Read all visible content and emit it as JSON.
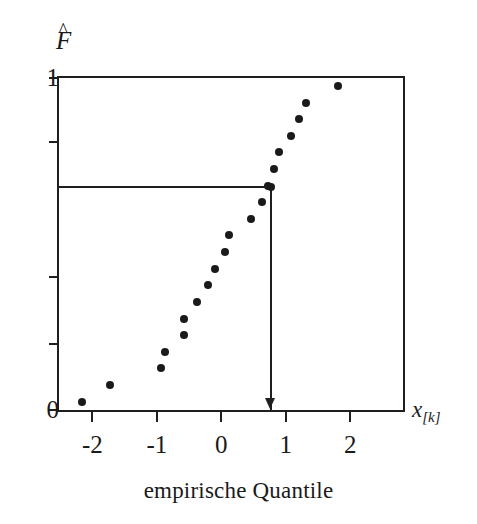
{
  "figure": {
    "caption": "empirische Quantile",
    "ylabel_base": "F",
    "ylabel_hat": "^",
    "xlabel_base": "x",
    "xlabel_sub": "[k]"
  },
  "chart_data": {
    "type": "scatter",
    "title": "",
    "subtitle": "",
    "xlabel": "x[k]",
    "ylabel": "F̂",
    "caption": "empirische Quantile",
    "xlim": [
      -2.55,
      2.85
    ],
    "ylim": [
      0,
      1
    ],
    "grid": false,
    "legend": null,
    "x_ticks": [
      -2,
      -1,
      0,
      1,
      2
    ],
    "x_tick_labels": [
      "-2",
      "-1",
      "0",
      "1",
      "2"
    ],
    "y_ticks": [
      0,
      0.2,
      0.4,
      0.805,
      1
    ],
    "y_tick_labels": [
      "0",
      "",
      "",
      "",
      "1"
    ],
    "y_labeled_ticks": [
      {
        "value": 1,
        "label": "1"
      },
      {
        "value": 0,
        "label": "0"
      }
    ],
    "series": [
      {
        "name": "empirische Verteilungsfunktion",
        "marker": "filled-circle",
        "color": "#1a1a1a",
        "points": [
          {
            "x": -2.16,
            "y": 0.025
          },
          {
            "x": -1.72,
            "y": 0.075
          },
          {
            "x": -0.94,
            "y": 0.125
          },
          {
            "x": -0.87,
            "y": 0.175
          },
          {
            "x": -0.58,
            "y": 0.225
          },
          {
            "x": -0.58,
            "y": 0.275
          },
          {
            "x": -0.37,
            "y": 0.325
          },
          {
            "x": -0.21,
            "y": 0.375
          },
          {
            "x": -0.1,
            "y": 0.425
          },
          {
            "x": 0.05,
            "y": 0.475
          },
          {
            "x": 0.12,
            "y": 0.525
          },
          {
            "x": 0.46,
            "y": 0.575
          },
          {
            "x": 0.63,
            "y": 0.625
          },
          {
            "x": 0.72,
            "y": 0.675
          },
          {
            "x": 0.81,
            "y": 0.725
          },
          {
            "x": 0.89,
            "y": 0.775
          },
          {
            "x": 1.08,
            "y": 0.825
          },
          {
            "x": 1.2,
            "y": 0.875
          },
          {
            "x": 1.32,
            "y": 0.925
          },
          {
            "x": 1.81,
            "y": 0.975
          }
        ]
      }
    ],
    "annotations": [
      {
        "type": "guide-lines",
        "description": "horizontal line from y-axis to highlighted quantile point, then vertical line down to x-axis ending in a downward arrow",
        "y": 0.67,
        "x": 0.77,
        "arrow": "down"
      }
    ]
  }
}
